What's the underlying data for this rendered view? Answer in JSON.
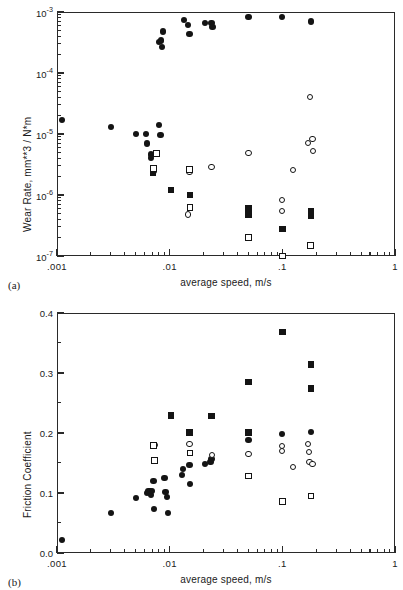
{
  "figure": {
    "panel_a_tag": "(a)",
    "panel_b_tag": "(b)"
  },
  "chart_data": [
    {
      "type": "scatter",
      "id": "a",
      "title": "",
      "xlabel": "average speed, m/s",
      "ylabel": "Wear Rate,  mm**3 / N*m",
      "xscale": "log",
      "yscale": "log",
      "xlim": [
        0.001,
        1
      ],
      "ylim": [
        1e-07,
        0.001
      ],
      "grid": false,
      "legend": "none",
      "xticks": [
        0.001,
        0.01,
        0.1,
        1
      ],
      "xticklabels": [
        ".001",
        ".01",
        ".1",
        "1"
      ],
      "yticks": [
        0.001,
        0.0001,
        1e-05,
        1e-06,
        1e-07
      ],
      "yticklabels": [
        "10-3",
        "10-4",
        "10-5",
        "10-6",
        "10-7"
      ],
      "yticklabel_mantissa": "10",
      "yticklabel_exponents": [
        "-3",
        "-4",
        "-5",
        "-6",
        "-7"
      ],
      "series": [
        {
          "name": "filled-circle",
          "marker": "filled-circle",
          "points": [
            [
              0.0011,
              1.7e-05
            ],
            [
              0.003,
              1.3e-05
            ],
            [
              0.005,
              1e-05
            ],
            [
              0.0062,
              1e-05
            ],
            [
              0.0063,
              7e-06
            ],
            [
              0.0068,
              4.6e-06
            ],
            [
              0.0068,
              4.1e-06
            ],
            [
              0.008,
              1.4e-05
            ],
            [
              0.0083,
              9.6e-06
            ],
            [
              0.0072,
              2.5e-06
            ],
            [
              0.008,
              0.00032
            ],
            [
              0.0084,
              0.00034
            ],
            [
              0.0085,
              0.00027
            ],
            [
              0.0088,
              0.00048
            ],
            [
              0.0135,
              0.00073
            ],
            [
              0.0145,
              0.00062
            ],
            [
              0.015,
              0.00043
            ],
            [
              0.0205,
              0.00066
            ],
            [
              0.0235,
              0.00067
            ],
            [
              0.024,
              0.00057
            ],
            [
              0.05,
              0.00082
            ],
            [
              0.1,
              0.00082
            ],
            [
              0.18,
              0.0007
            ]
          ]
        },
        {
          "name": "open-circle",
          "marker": "open-circle",
          "points": [
            [
              0.0072,
              2.6e-06
            ],
            [
              0.015,
              2.4e-06
            ],
            [
              0.0235,
              2.9e-06
            ],
            [
              0.0145,
              4.8e-07
            ],
            [
              0.05,
              4.9e-06
            ],
            [
              0.1,
              8.2e-07
            ],
            [
              0.1,
              5.5e-07
            ],
            [
              0.125,
              2.6e-06
            ],
            [
              0.175,
              4.1e-05
            ],
            [
              0.17,
              7.2e-06
            ],
            [
              0.185,
              8.2e-06
            ],
            [
              0.188,
              5.2e-06
            ]
          ]
        },
        {
          "name": "filled-square",
          "marker": "filled-square",
          "points": [
            [
              0.0071,
              2.3e-06
            ],
            [
              0.0103,
              1.2e-06
            ],
            [
              0.0152,
              1e-06
            ],
            [
              0.05,
              6e-07
            ],
            [
              0.05,
              4.7e-07
            ],
            [
              0.1,
              2.8e-07
            ],
            [
              0.18,
              5.4e-07
            ],
            [
              0.18,
              4.6e-07
            ]
          ]
        },
        {
          "name": "open-square",
          "marker": "open-square",
          "points": [
            [
              0.0076,
              4.8e-06
            ],
            [
              0.0072,
              2.7e-06
            ],
            [
              0.015,
              2.6e-06
            ],
            [
              0.0152,
              6.2e-07
            ],
            [
              0.05,
              2e-07
            ],
            [
              0.1,
              1e-07
            ],
            [
              0.178,
              1.5e-07
            ]
          ]
        }
      ]
    },
    {
      "type": "scatter",
      "id": "b",
      "title": "",
      "xlabel": "average speed, m/s",
      "ylabel": "Friction  Coefficient",
      "xscale": "log",
      "yscale": "linear",
      "xlim": [
        0.001,
        1
      ],
      "ylim": [
        0.0,
        0.4
      ],
      "grid": false,
      "legend": "none",
      "xticks": [
        0.001,
        0.01,
        0.1,
        1
      ],
      "xticklabels": [
        ".001",
        ".01",
        ".1",
        "1"
      ],
      "yticks": [
        0.0,
        0.1,
        0.2,
        0.3,
        0.4
      ],
      "yticklabels": [
        "0.0",
        "0.1",
        "0.2",
        "0.3",
        "0.4"
      ],
      "series": [
        {
          "name": "filled-circle",
          "marker": "filled-circle",
          "points": [
            [
              0.0011,
              0.022
            ],
            [
              0.003,
              0.066
            ],
            [
              0.005,
              0.091
            ],
            [
              0.0063,
              0.1
            ],
            [
              0.0065,
              0.103
            ],
            [
              0.0067,
              0.104
            ],
            [
              0.0068,
              0.096
            ],
            [
              0.007,
              0.103
            ],
            [
              0.0072,
              0.12
            ],
            [
              0.0073,
              0.073
            ],
            [
              0.009,
              0.125
            ],
            [
              0.0092,
              0.102
            ],
            [
              0.0094,
              0.093
            ],
            [
              0.0096,
              0.067
            ],
            [
              0.0128,
              0.13
            ],
            [
              0.0131,
              0.14
            ],
            [
              0.015,
              0.146
            ],
            [
              0.0152,
              0.115
            ],
            [
              0.0205,
              0.149
            ],
            [
              0.023,
              0.152
            ],
            [
              0.0235,
              0.156
            ],
            [
              0.05,
              0.189
            ],
            [
              0.1,
              0.199
            ],
            [
              0.18,
              0.201
            ]
          ]
        },
        {
          "name": "open-circle",
          "marker": "open-circle",
          "points": [
            [
              0.0074,
              0.18
            ],
            [
              0.015,
              0.181
            ],
            [
              0.0238,
              0.164
            ],
            [
              0.05,
              0.165
            ],
            [
              0.1,
              0.179
            ],
            [
              0.1,
              0.17
            ],
            [
              0.125,
              0.143
            ],
            [
              0.17,
              0.182
            ],
            [
              0.172,
              0.169
            ],
            [
              0.174,
              0.151
            ],
            [
              0.185,
              0.149
            ]
          ]
        },
        {
          "name": "filled-square",
          "marker": "filled-square",
          "points": [
            [
              0.0103,
              0.229
            ],
            [
              0.015,
              0.201
            ],
            [
              0.0235,
              0.228
            ],
            [
              0.05,
              0.285
            ],
            [
              0.05,
              0.201
            ],
            [
              0.1,
              0.368
            ],
            [
              0.18,
              0.314
            ],
            [
              0.18,
              0.274
            ]
          ]
        },
        {
          "name": "open-square",
          "marker": "open-square",
          "points": [
            [
              0.0072,
              0.179
            ],
            [
              0.0073,
              0.154
            ],
            [
              0.0152,
              0.167
            ],
            [
              0.05,
              0.128
            ],
            [
              0.1,
              0.086
            ],
            [
              0.18,
              0.095
            ]
          ]
        }
      ]
    }
  ]
}
